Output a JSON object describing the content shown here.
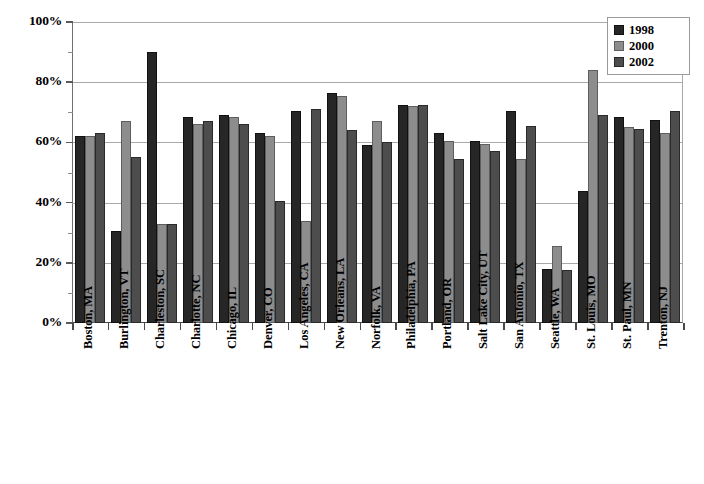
{
  "chart_data": {
    "type": "bar",
    "title": "",
    "subtitle": "",
    "xlabel": "",
    "ylabel": "",
    "ylim": [
      0,
      100
    ],
    "ytick_labels": [
      "0%",
      "20%",
      "40%",
      "60%",
      "80%",
      "100%"
    ],
    "ytick_values": [
      0,
      20,
      40,
      60,
      80,
      100
    ],
    "grid": "horizontal",
    "legend_position": "top-right",
    "value_format": "percent",
    "categories": [
      "Boston, MA",
      "Burlington, VT",
      "Charleston, SC",
      "Charlotte, NC",
      "Chicago, IL",
      "Denver, CO",
      "Los Angeles, CA",
      "New Orleans, LA",
      "Norfolk, VA",
      "Philadelphia, PA",
      "Portland, OR",
      "Salt Lake City, UT",
      "San Antonio, TX",
      "Seattle, WA",
      "St. Louis, MO",
      "St. Paul, MN",
      "Trenton, NJ"
    ],
    "series": [
      {
        "name": "1998",
        "color": "#262626",
        "values": [
          62,
          30.5,
          90,
          68.5,
          69,
          63,
          70.5,
          76.5,
          59,
          72.5,
          63,
          60.5,
          70.5,
          18,
          44,
          68.5,
          67.5
        ]
      },
      {
        "name": "2000",
        "color": "#8d8d8d",
        "values": [
          62,
          67,
          33,
          66,
          68.5,
          62,
          34,
          75.5,
          67,
          72,
          60.5,
          59.5,
          54.5,
          25.5,
          84,
          65,
          63
        ]
      },
      {
        "name": "2002",
        "color": "#4d4d4d",
        "values": [
          63,
          55,
          33,
          67,
          66,
          40.5,
          71,
          64,
          60,
          72.5,
          54.5,
          57,
          65.5,
          17.5,
          69,
          64.5,
          70.5
        ]
      }
    ]
  },
  "legend": {
    "entries": [
      {
        "label": "1998",
        "swatch": "legend-swatch-1998"
      },
      {
        "label": "2000",
        "swatch": "legend-swatch-2000"
      },
      {
        "label": "2002",
        "swatch": "legend-swatch-2002"
      }
    ]
  }
}
